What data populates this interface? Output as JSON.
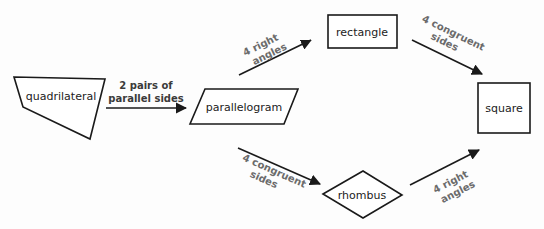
{
  "diagram": {
    "type": "flowchart",
    "nodes": {
      "quadrilateral": {
        "label": "quadrilateral",
        "shape": "irregular-quadrilateral"
      },
      "parallelogram": {
        "label": "parallelogram",
        "shape": "parallelogram"
      },
      "rectangle": {
        "label": "rectangle",
        "shape": "rectangle"
      },
      "rhombus": {
        "label": "rhombus",
        "shape": "diamond"
      },
      "square": {
        "label": "square",
        "shape": "square"
      }
    },
    "edges": {
      "quad_to_para": {
        "from": "quadrilateral",
        "to": "parallelogram",
        "line1": "2 pairs of",
        "line2": "parallel sides"
      },
      "para_to_rect": {
        "from": "parallelogram",
        "to": "rectangle",
        "line1": "4 right",
        "line2": "angles"
      },
      "rect_to_square": {
        "from": "rectangle",
        "to": "square",
        "line1": "4 congruent",
        "line2": "sides"
      },
      "para_to_rhombus": {
        "from": "parallelogram",
        "to": "rhombus",
        "line1": "4 congruent",
        "line2": "sides"
      },
      "rhombus_to_square": {
        "from": "rhombus",
        "to": "square",
        "line1": "4 right",
        "line2": "angles"
      }
    },
    "colors": {
      "stroke": "#1a1a1a",
      "node_text": "#222222",
      "edge_text": "#6b6b6b",
      "background": "#fdfdfd"
    }
  }
}
